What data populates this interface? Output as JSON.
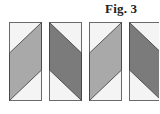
{
  "figure": {
    "title": "Fig. 3",
    "colors": {
      "background": "#ffffff",
      "outline": "#6a6a6a",
      "light_fill": "#f4f4f4",
      "medium_fill": "#a9a9a9",
      "dark_fill": "#7b7b7b"
    },
    "panels": [
      {
        "id": 1,
        "band": "medium",
        "direction": "rising"
      },
      {
        "id": 2,
        "band": "dark",
        "direction": "falling"
      },
      {
        "id": 3,
        "band": "medium",
        "direction": "rising"
      },
      {
        "id": 4,
        "band": "dark",
        "direction": "falling"
      }
    ]
  }
}
